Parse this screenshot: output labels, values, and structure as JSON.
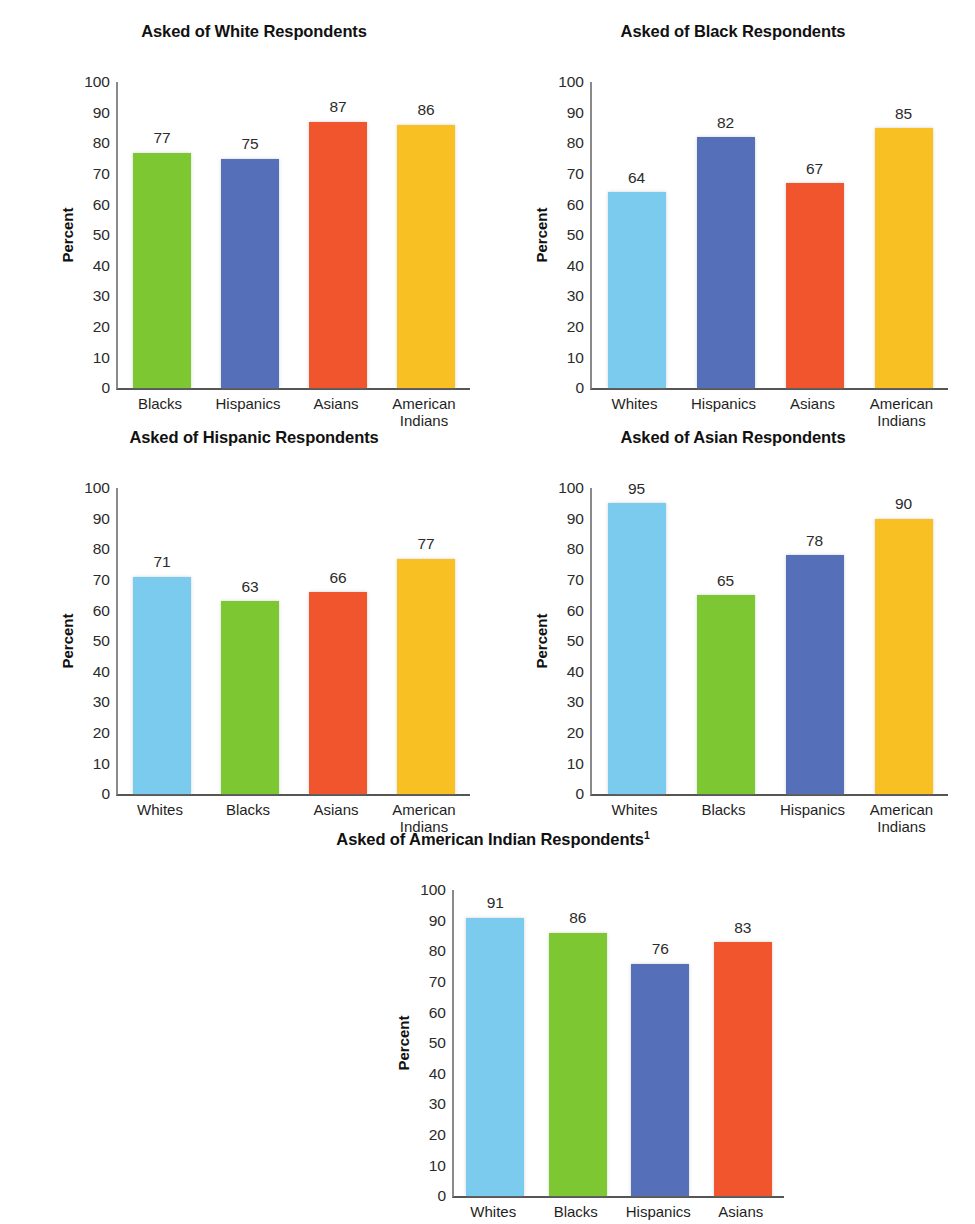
{
  "page": {
    "clipped_header_line": "",
    "background": "#ffffff"
  },
  "palette": {
    "green": "#7DC832",
    "blue": "#5570B8",
    "red": "#F0552E",
    "yellow": "#F9C024",
    "light_blue": "#7BCBEE"
  },
  "axis": {
    "ylabel": "Percent",
    "ticks": [
      "100",
      "90",
      "80",
      "70",
      "60",
      "50",
      "40",
      "30",
      "20",
      "10",
      "0"
    ]
  },
  "charts": [
    {
      "id": "white-respondents",
      "title": "Asked of White Respondents",
      "footnote_marker": "",
      "ylabel": "Percent",
      "categories": [
        "Blacks",
        "Hispanics",
        "Asians",
        "American\nIndians"
      ],
      "values": [
        77,
        75,
        87,
        86
      ],
      "colors": [
        "#7DC832",
        "#5570B8",
        "#F0552E",
        "#F9C024"
      ]
    },
    {
      "id": "black-respondents",
      "title": "Asked of Black Respondents",
      "footnote_marker": "",
      "ylabel": "Percent",
      "categories": [
        "Whites",
        "Hispanics",
        "Asians",
        "American\nIndians"
      ],
      "values": [
        64,
        82,
        67,
        85
      ],
      "colors": [
        "#7BCBEE",
        "#5570B8",
        "#F0552E",
        "#F9C024"
      ]
    },
    {
      "id": "hispanic-respondents",
      "title": "Asked of Hispanic Respondents",
      "footnote_marker": "",
      "ylabel": "Percent",
      "categories": [
        "Whites",
        "Blacks",
        "Asians",
        "American\nIndians"
      ],
      "values": [
        71,
        63,
        66,
        77
      ],
      "colors": [
        "#7BCBEE",
        "#7DC832",
        "#F0552E",
        "#F9C024"
      ]
    },
    {
      "id": "asian-respondents",
      "title": "Asked of Asian Respondents",
      "footnote_marker": "",
      "ylabel": "Percent",
      "categories": [
        "Whites",
        "Blacks",
        "Hispanics",
        "American\nIndians"
      ],
      "values": [
        95,
        65,
        78,
        90
      ],
      "colors": [
        "#7BCBEE",
        "#7DC832",
        "#5570B8",
        "#F9C024"
      ]
    },
    {
      "id": "american-indian-respondents",
      "title": "Asked of American Indian Respondents",
      "footnote_marker": "1",
      "ylabel": "Percent",
      "categories": [
        "Whites",
        "Blacks",
        "Hispanics",
        "Asians"
      ],
      "values": [
        91,
        86,
        76,
        83
      ],
      "colors": [
        "#7BCBEE",
        "#7DC832",
        "#5570B8",
        "#F0552E"
      ]
    }
  ],
  "chart_data": [
    {
      "type": "bar",
      "title": "Asked of White Respondents",
      "xlabel": "",
      "ylabel": "Percent",
      "ylim": [
        0,
        100
      ],
      "ytick_step": 10,
      "grid": false,
      "legend": "none",
      "categories": [
        "Blacks",
        "Hispanics",
        "Asians",
        "American Indians"
      ],
      "values": [
        77,
        75,
        87,
        86
      ],
      "bar_colors": [
        "#7DC832",
        "#5570B8",
        "#F0552E",
        "#F9C024"
      ],
      "data_labels": [
        77,
        75,
        87,
        86
      ]
    },
    {
      "type": "bar",
      "title": "Asked of Black Respondents",
      "xlabel": "",
      "ylabel": "Percent",
      "ylim": [
        0,
        100
      ],
      "ytick_step": 10,
      "grid": false,
      "legend": "none",
      "categories": [
        "Whites",
        "Hispanics",
        "Asians",
        "American Indians"
      ],
      "values": [
        64,
        82,
        67,
        85
      ],
      "bar_colors": [
        "#7BCBEE",
        "#5570B8",
        "#F0552E",
        "#F9C024"
      ],
      "data_labels": [
        64,
        82,
        67,
        85
      ]
    },
    {
      "type": "bar",
      "title": "Asked of Hispanic Respondents",
      "xlabel": "",
      "ylabel": "Percent",
      "ylim": [
        0,
        100
      ],
      "ytick_step": 10,
      "grid": false,
      "legend": "none",
      "categories": [
        "Whites",
        "Blacks",
        "Asians",
        "American Indians"
      ],
      "values": [
        71,
        63,
        66,
        77
      ],
      "bar_colors": [
        "#7BCBEE",
        "#7DC832",
        "#F0552E",
        "#F9C024"
      ],
      "data_labels": [
        71,
        63,
        66,
        77
      ]
    },
    {
      "type": "bar",
      "title": "Asked of Asian Respondents",
      "xlabel": "",
      "ylabel": "Percent",
      "ylim": [
        0,
        100
      ],
      "ytick_step": 10,
      "grid": false,
      "legend": "none",
      "categories": [
        "Whites",
        "Blacks",
        "Hispanics",
        "American Indians"
      ],
      "values": [
        95,
        65,
        78,
        90
      ],
      "bar_colors": [
        "#7BCBEE",
        "#7DC832",
        "#5570B8",
        "#F9C024"
      ],
      "data_labels": [
        95,
        65,
        78,
        90
      ]
    },
    {
      "type": "bar",
      "title": "Asked of American Indian Respondents1",
      "xlabel": "",
      "ylabel": "Percent",
      "ylim": [
        0,
        100
      ],
      "ytick_step": 10,
      "grid": false,
      "legend": "none",
      "categories": [
        "Whites",
        "Blacks",
        "Hispanics",
        "Asians"
      ],
      "values": [
        91,
        86,
        76,
        83
      ],
      "bar_colors": [
        "#7BCBEE",
        "#7DC832",
        "#5570B8",
        "#F0552E"
      ],
      "data_labels": [
        91,
        86,
        76,
        83
      ]
    }
  ]
}
